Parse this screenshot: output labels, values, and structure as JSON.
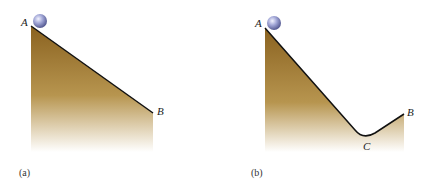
{
  "figure": {
    "panels": [
      {
        "id": "a",
        "caption": "(a)",
        "points": {
          "A": "A",
          "B": "B"
        },
        "description": "Ball at point A at top of straight incline descending to point B"
      },
      {
        "id": "b",
        "caption": "(b)",
        "points": {
          "A": "A",
          "B": "B",
          "C": "C"
        },
        "description": "Ball at point A at top of incline descending to valley C then rising to point B"
      }
    ],
    "colors": {
      "ground_top": "#8a6220",
      "ground_bottom": "#ffffff",
      "ball": "#8d93c8",
      "edge": "#111111"
    }
  }
}
